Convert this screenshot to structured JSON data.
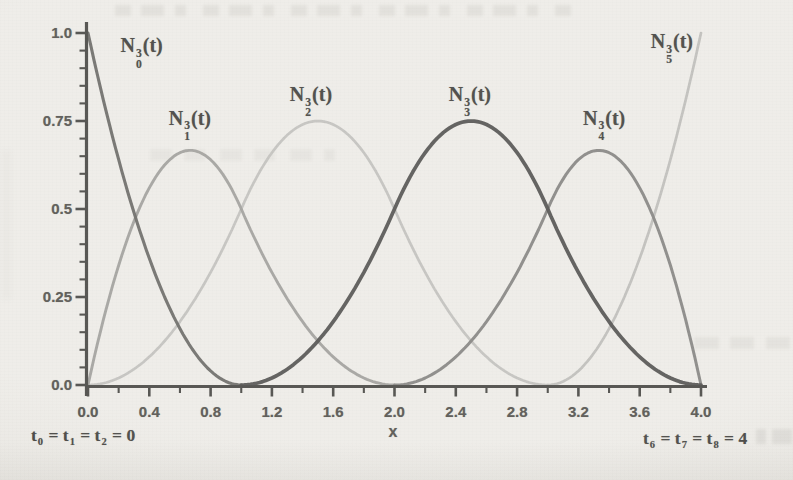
{
  "page": {
    "background_color": "#ebe9e4",
    "description_colors": {
      "axis": "#2d2c28",
      "tick_label": "#3a3833",
      "curve_label": "#262521"
    }
  },
  "chart_data": {
    "type": "line",
    "title": "",
    "xlabel": "x",
    "ylabel": "",
    "xlim": [
      0,
      4
    ],
    "ylim": [
      0,
      1.0
    ],
    "grid": false,
    "legend_position": "inline-curve-labels",
    "x_major_ticks": {
      "values": [
        0.0,
        0.4,
        0.8,
        1.2,
        1.6,
        2.0,
        2.4,
        2.8,
        3.2,
        3.6,
        4.0
      ],
      "labels": [
        "0.0",
        "0.4",
        "0.8",
        "1.2",
        "1.6",
        "2.0",
        "2.4",
        "2.8",
        "3.2",
        "3.6",
        "4.0"
      ]
    },
    "x_minor_step": 0.2,
    "y_major_ticks": {
      "values": [
        0.0,
        0.25,
        0.5,
        0.75,
        1.0
      ],
      "labels": [
        "0.0",
        "0.25",
        "0.5",
        "0.75",
        "1.0"
      ]
    },
    "y_minor_step": 0.05,
    "bspline": {
      "degree": 2,
      "knots": [
        0,
        0,
        0,
        1,
        2,
        3,
        4,
        4,
        4
      ]
    },
    "samples_x": [
      0,
      0.25,
      0.5,
      0.75,
      1,
      1.25,
      1.5,
      1.75,
      2,
      2.25,
      2.5,
      2.75,
      3,
      3.25,
      3.5,
      3.75,
      4
    ],
    "series": [
      {
        "name": "N0",
        "label": "N_0^3(t)",
        "basis_index": 0,
        "color": "#504f4b",
        "stroke_width": 3.1,
        "label_pos": [
          0.35,
          0.945
        ],
        "peak": [
          0,
          1
        ],
        "values": [
          1,
          0.5625,
          0.25,
          0.0625,
          0,
          0,
          0,
          0,
          0,
          0,
          0,
          0,
          0,
          0,
          0,
          0,
          0
        ]
      },
      {
        "name": "N1",
        "label": "N_1^3(t)",
        "basis_index": 1,
        "color": "#8f8e8a",
        "stroke_width": 2.9,
        "label_pos": [
          0.665,
          0.74
        ],
        "peak": [
          0.6667,
          0.6667
        ],
        "values": [
          0,
          0.40625,
          0.625,
          0.65625,
          0.5,
          0.28125,
          0.125,
          0.03125,
          0,
          0,
          0,
          0,
          0,
          0,
          0,
          0,
          0
        ]
      },
      {
        "name": "N2",
        "label": "N_2^3(t)",
        "basis_index": 2,
        "color": "#b6b5b1",
        "stroke_width": 2.7,
        "label_pos": [
          1.455,
          0.807
        ],
        "peak": [
          1.5,
          0.75
        ],
        "values": [
          0,
          0.03125,
          0.125,
          0.28125,
          0.5,
          0.6875,
          0.75,
          0.6875,
          0.5,
          0.28125,
          0.125,
          0.03125,
          0,
          0,
          0,
          0,
          0
        ]
      },
      {
        "name": "N3",
        "label": "N_3^3(t)",
        "basis_index": 3,
        "color": "#343330",
        "stroke_width": 3.7,
        "label_pos": [
          2.492,
          0.807
        ],
        "peak": [
          2.5,
          0.75
        ],
        "values": [
          0,
          0,
          0,
          0,
          0,
          0.03125,
          0.125,
          0.28125,
          0.5,
          0.6875,
          0.75,
          0.6875,
          0.5,
          0.28125,
          0.125,
          0.03125,
          0
        ]
      },
      {
        "name": "N4",
        "label": "N_4^3(t)",
        "basis_index": 4,
        "color": "#6f6e6a",
        "stroke_width": 3.0,
        "label_pos": [
          3.368,
          0.74
        ],
        "peak": [
          3.3333,
          0.6667
        ],
        "values": [
          0,
          0,
          0,
          0,
          0,
          0,
          0,
          0,
          0,
          0.03125,
          0.125,
          0.28125,
          0.5,
          0.65625,
          0.625,
          0.40625,
          0
        ]
      },
      {
        "name": "N5",
        "label": "N_5^3(t)",
        "basis_index": 5,
        "color": "#b2b1ad",
        "stroke_width": 2.7,
        "label_pos": [
          3.81,
          0.957
        ],
        "peak": [
          4,
          1
        ],
        "values": [
          0,
          0,
          0,
          0,
          0,
          0,
          0,
          0,
          0,
          0,
          0,
          0,
          0,
          0.0625,
          0.25,
          0.5625,
          1
        ]
      }
    ],
    "annotations": [
      {
        "id": "knots-left",
        "text": "t_0 = t_1 = t_2 = 0"
      },
      {
        "id": "knots-right",
        "text": "t_6 = t_7 = t_8 = 4"
      }
    ]
  }
}
